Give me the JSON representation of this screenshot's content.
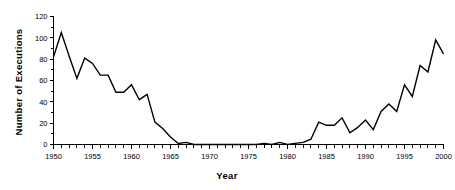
{
  "chart_data": {
    "type": "line",
    "title": "",
    "xlabel": "Year",
    "ylabel": "Number of Executions",
    "xlim": [
      1950,
      2000
    ],
    "ylim": [
      0,
      120
    ],
    "grid": false,
    "legend": null,
    "line_color": "#000000",
    "y_ticks": [
      0,
      20,
      40,
      60,
      80,
      100,
      120
    ],
    "y_tick_labels": [
      "0",
      "20",
      "40",
      "60",
      "80",
      "100",
      "120"
    ],
    "y_minor_tick_step": 10,
    "x_ticks": [
      1950,
      1955,
      1960,
      1965,
      1970,
      1975,
      1980,
      1985,
      1990,
      1995,
      2000
    ],
    "x_tick_labels": [
      "1950",
      "1955",
      "1960",
      "1965",
      "1970",
      "1975",
      "1980",
      "1985",
      "1990",
      "1995",
      "2000"
    ],
    "x_minor_tick_step": 1,
    "x": [
      1950,
      1951,
      1952,
      1953,
      1954,
      1955,
      1956,
      1957,
      1958,
      1959,
      1960,
      1961,
      1962,
      1963,
      1964,
      1965,
      1966,
      1967,
      1968,
      1969,
      1970,
      1971,
      1972,
      1973,
      1974,
      1975,
      1976,
      1977,
      1978,
      1979,
      1980,
      1981,
      1982,
      1983,
      1984,
      1985,
      1986,
      1987,
      1988,
      1989,
      1990,
      1991,
      1992,
      1993,
      1994,
      1995,
      1996,
      1997,
      1998,
      1999,
      2000
    ],
    "values": [
      82,
      105,
      83,
      62,
      81,
      76,
      65,
      65,
      49,
      49,
      56,
      42,
      47,
      21,
      15,
      7,
      1,
      2,
      0,
      0,
      0,
      0,
      0,
      0,
      0,
      0,
      0,
      1,
      0,
      2,
      0,
      1,
      2,
      5,
      21,
      18,
      18,
      25,
      11,
      16,
      23,
      14,
      31,
      38,
      31,
      56,
      45,
      74,
      68,
      98,
      85
    ]
  },
  "axis": {
    "y_title": "Number of Executions",
    "x_title": "Year"
  }
}
